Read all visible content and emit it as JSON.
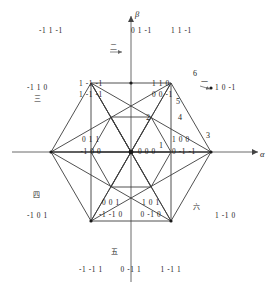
{
  "figure": {
    "type": "space-vector-hexagon",
    "axes": {
      "alpha": "α",
      "beta": "β"
    },
    "center_state": "0 0 0",
    "geometry": {
      "center": [
        131,
        152
      ],
      "radius": 80,
      "outer_vertices": [
        [
          211,
          152
        ],
        [
          171,
          83
        ],
        [
          91,
          83
        ],
        [
          51,
          152
        ],
        [
          91,
          221
        ],
        [
          171,
          221
        ]
      ],
      "mid_vertices": [
        [
          171,
          152
        ],
        [
          151,
          117
        ],
        [
          111,
          117
        ],
        [
          91,
          152
        ],
        [
          111,
          187
        ],
        [
          151,
          187
        ]
      ]
    }
  },
  "states": [
    {
      "text": "-1 1 -1",
      "x": 51,
      "y": 31,
      "anchor": "mid"
    },
    {
      "text": "0 1 -1",
      "x": 131,
      "y": 31,
      "anchor": "start"
    },
    {
      "text": "1 1 -1",
      "x": 171,
      "y": 31,
      "anchor": "start"
    },
    {
      "text": "1 -1 -1",
      "x": 91,
      "y": 84,
      "anchor": "mid"
    },
    {
      "text": "1 -1 -1",
      "x": 91,
      "y": 95,
      "anchor": "mid"
    },
    {
      "text": "1 1 0",
      "x": 152,
      "y": 84,
      "anchor": "start"
    },
    {
      "text": "0 0 -1",
      "x": 152,
      "y": 95,
      "anchor": "start"
    },
    {
      "text": "-1 1 0",
      "x": 48,
      "y": 88,
      "anchor": "end"
    },
    {
      "text": "1 0 -1",
      "x": 215,
      "y": 88,
      "anchor": "start"
    },
    {
      "text": "0 1 1",
      "x": 91,
      "y": 140,
      "anchor": "mid"
    },
    {
      "text": "-1 0 0",
      "x": 91,
      "y": 152,
      "anchor": "mid"
    },
    {
      "text": "0 0 0",
      "x": 138,
      "y": 152,
      "anchor": "start"
    },
    {
      "text": "1 0 0",
      "x": 172,
      "y": 140,
      "anchor": "start"
    },
    {
      "text": "0 -1 -1",
      "x": 172,
      "y": 152,
      "anchor": "start"
    },
    {
      "text": "0 0 1",
      "x": 111,
      "y": 203,
      "anchor": "mid"
    },
    {
      "text": "-1 -1 0",
      "x": 111,
      "y": 215,
      "anchor": "mid"
    },
    {
      "text": "1 0 1",
      "x": 151,
      "y": 203,
      "anchor": "mid"
    },
    {
      "text": "0 -1 0",
      "x": 151,
      "y": 215,
      "anchor": "mid"
    },
    {
      "text": "-1 0 1",
      "x": 48,
      "y": 216,
      "anchor": "end"
    },
    {
      "text": "1 -1 0",
      "x": 215,
      "y": 216,
      "anchor": "start"
    },
    {
      "text": "-1 -1 1",
      "x": 91,
      "y": 270,
      "anchor": "mid"
    },
    {
      "text": "0 -1 1",
      "x": 131,
      "y": 270,
      "anchor": "mid"
    },
    {
      "text": "1 -1 1",
      "x": 171,
      "y": 270,
      "anchor": "mid"
    }
  ],
  "sectors": [
    {
      "label": "1",
      "x": 161,
      "y": 146
    },
    {
      "label": "2",
      "x": 148,
      "y": 118
    },
    {
      "label": "3",
      "x": 208,
      "y": 136
    },
    {
      "label": "4",
      "x": 180,
      "y": 118
    },
    {
      "label": "5",
      "x": 178,
      "y": 102
    },
    {
      "label": "6",
      "x": 195,
      "y": 74
    }
  ],
  "cn_numerals": [
    {
      "label": "一",
      "x": 204,
      "y": 83
    },
    {
      "label": "二",
      "x": 113,
      "y": 48
    },
    {
      "label": "三",
      "x": 37,
      "y": 100
    },
    {
      "label": "四",
      "x": 36,
      "y": 196
    },
    {
      "label": "五",
      "x": 114,
      "y": 253
    },
    {
      "label": "六",
      "x": 196,
      "y": 208
    }
  ]
}
